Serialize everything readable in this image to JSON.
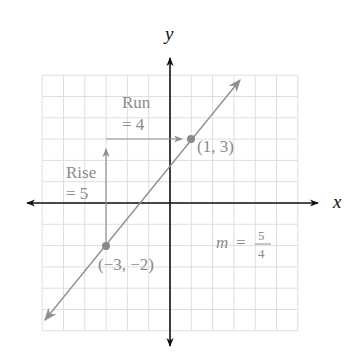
{
  "chart_data": {
    "type": "line",
    "title": "",
    "xlabel": "x",
    "ylabel": "y",
    "xlim": [
      -6,
      6
    ],
    "ylim": [
      -6,
      6
    ],
    "grid": true,
    "grid_step": 1,
    "series": [
      {
        "name": "line through (-3,-2) and (1,3)",
        "points": [
          [
            -3,
            -2
          ],
          [
            1,
            3
          ]
        ],
        "slope": 1.25,
        "intercept": 1.75,
        "extends_both_directions": true
      }
    ],
    "annotations": [
      {
        "text": "(1, 3)",
        "x": 1,
        "y": 3
      },
      {
        "text": "(−3, −2)",
        "x": -3,
        "y": -2
      },
      {
        "text": "Rise = 5",
        "from": [
          -3,
          -2
        ],
        "to": [
          -3,
          3
        ],
        "direction": "vertical"
      },
      {
        "text": "Run = 4",
        "from": [
          -3,
          3
        ],
        "to": [
          1,
          3
        ],
        "direction": "horizontal"
      },
      {
        "text": "m = 5/4"
      }
    ]
  },
  "labels": {
    "x_axis": "x",
    "y_axis": "y",
    "point_a": "(1, 3)",
    "point_b": "(−3, −2)",
    "run_line1": "Run",
    "run_line2": "= 4",
    "rise_line1": "Rise",
    "rise_line2": "= 5",
    "slope_m": "m",
    "slope_eq": "=",
    "slope_num": "5",
    "slope_den": "4"
  },
  "colors": {
    "axis": "#111111",
    "line": "#8a8a8a",
    "grid": "#dcdcdc",
    "text": "#8a8a8a"
  }
}
